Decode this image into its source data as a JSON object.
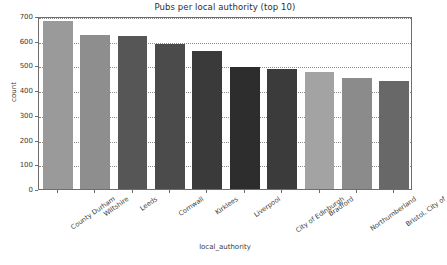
{
  "chart_data": {
    "type": "bar",
    "title": "Pubs per local authority (top 10)",
    "xlabel": "local_authority",
    "ylabel": "count",
    "categories": [
      "County Durham",
      "Wiltshire",
      "Leeds",
      "Cornwall",
      "Kirklees",
      "Liverpool",
      "City of Edinburgh",
      "Bradford",
      "Northumberland",
      "Bristol, City of"
    ],
    "values": [
      680,
      625,
      621,
      586,
      560,
      492,
      484,
      472,
      450,
      439
    ],
    "bar_colors": [
      "#9a9a9a",
      "#8e8e8e",
      "#565656",
      "#4b4b4b",
      "#3a3a3a",
      "#2d2d2d",
      "#3b3b3b",
      "#a3a3a3",
      "#8b8b8b",
      "#686868"
    ],
    "ylim": [
      0,
      700
    ],
    "yticks": [
      0,
      100,
      200,
      300,
      400,
      500,
      600,
      700
    ],
    "ytick_labels": [
      "0",
      "100",
      "200",
      "300",
      "400",
      "500",
      "600",
      "700"
    ],
    "grid": true,
    "legend": "none",
    "background": "#ffffff"
  }
}
